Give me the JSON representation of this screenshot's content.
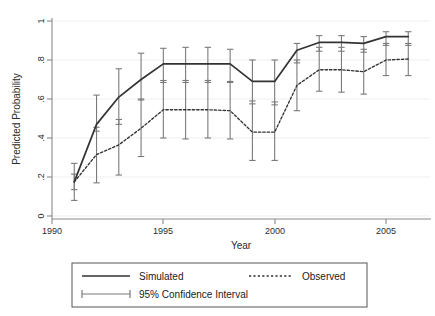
{
  "chart_data": {
    "type": "line",
    "title": "",
    "xlabel": "Year",
    "ylabel": "Predicted Probability",
    "xlim": [
      1990,
      2006.4
    ],
    "ylim": [
      0,
      1
    ],
    "xticks": [
      1990,
      1995,
      2000,
      2005
    ],
    "xticklabels": [
      "1990",
      "1995",
      "2000",
      "2005"
    ],
    "yticks": [
      0,
      0.2,
      0.4,
      0.6,
      0.8,
      1
    ],
    "yticklabels": [
      "0",
      ".2",
      ".4",
      ".6",
      ".8",
      "1"
    ],
    "grid": "horizontal",
    "legend_position": "below-axes",
    "x": [
      1991,
      1992,
      1993,
      1994,
      1995,
      1996,
      1997,
      1998,
      1999,
      2000,
      2001,
      2002,
      2003,
      2004,
      2005,
      2006
    ],
    "series": [
      {
        "name": "Simulated",
        "style": "solid",
        "color": "#333333",
        "values": [
          0.175,
          0.47,
          0.61,
          0.7,
          0.78,
          0.78,
          0.78,
          0.78,
          0.69,
          0.69,
          0.85,
          0.89,
          0.89,
          0.885,
          0.92,
          0.92
        ],
        "ci_low": [
          0.135,
          0.435,
          0.47,
          0.595,
          0.685,
          0.685,
          0.685,
          0.685,
          0.575,
          0.57,
          0.785,
          0.845,
          0.845,
          0.84,
          0.875,
          0.875
        ],
        "ci_high": [
          0.215,
          0.62,
          0.755,
          0.835,
          0.86,
          0.865,
          0.865,
          0.855,
          0.8,
          0.8,
          0.885,
          0.925,
          0.925,
          0.92,
          0.945,
          0.945
        ]
      },
      {
        "name": "Observed",
        "style": "dotted",
        "color": "#333333",
        "values": [
          0.175,
          0.315,
          0.365,
          0.45,
          0.545,
          0.545,
          0.545,
          0.54,
          0.43,
          0.43,
          0.67,
          0.75,
          0.75,
          0.74,
          0.8,
          0.805
        ],
        "ci_low": [
          0.08,
          0.17,
          0.21,
          0.305,
          0.4,
          0.395,
          0.4,
          0.395,
          0.285,
          0.285,
          0.54,
          0.64,
          0.635,
          0.625,
          0.72,
          0.72
        ],
        "ci_high": [
          0.27,
          0.455,
          0.495,
          0.6,
          0.695,
          0.695,
          0.695,
          0.69,
          0.59,
          0.585,
          0.8,
          0.865,
          0.865,
          0.855,
          0.885,
          0.885
        ]
      }
    ],
    "legend_entries": [
      {
        "label": "Simulated",
        "marker": "solid-line"
      },
      {
        "label": "Observed",
        "marker": "dotted-line"
      },
      {
        "label": "95% Confidence Interval",
        "marker": "error-bar"
      }
    ]
  },
  "axes": {
    "x_axis_title": "Year",
    "y_axis_title": "Predicted Probability"
  },
  "colors": {
    "line": "#333333",
    "error_bar": "#7a7a7a",
    "grid": "#eeeeee",
    "axis": "#8a8a8a",
    "legend_border": "#555555",
    "background": "#ffffff"
  }
}
